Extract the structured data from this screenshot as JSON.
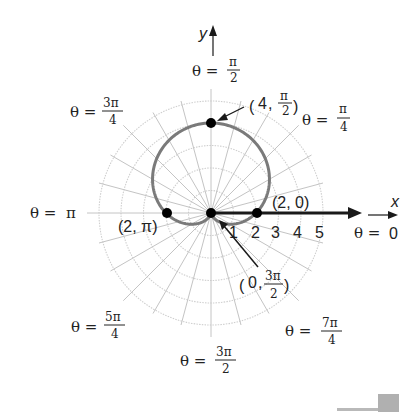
{
  "chart_data": {
    "type": "polar",
    "title": "",
    "equation_depicted": "cardioid r = 2 + 2 sin θ",
    "axes": {
      "x_label": "x",
      "y_label": "y",
      "polar_axis_label": "θ = 0",
      "radial_ticks": [
        "1",
        "2",
        "3",
        "4",
        "5"
      ],
      "radial_range": [
        0,
        5
      ],
      "grid": true
    },
    "angle_labels": [
      {
        "name": "theta-0",
        "eq": "θ = ",
        "num": "0",
        "den": ""
      },
      {
        "name": "theta-pi-4",
        "eq": "θ = ",
        "num": "π",
        "den": "4"
      },
      {
        "name": "theta-pi-2",
        "eq": "θ = ",
        "num": "π",
        "den": "2"
      },
      {
        "name": "theta-3pi-4",
        "eq": "θ = ",
        "num": "3π",
        "den": "4"
      },
      {
        "name": "theta-pi",
        "eq": "θ = ",
        "num": "π",
        "den": ""
      },
      {
        "name": "theta-5pi-4",
        "eq": "θ = ",
        "num": "5π",
        "den": "4"
      },
      {
        "name": "theta-3pi-2",
        "eq": "θ = ",
        "num": "3π",
        "den": "2"
      },
      {
        "name": "theta-7pi-4",
        "eq": "θ = ",
        "num": "7π",
        "den": "4"
      }
    ],
    "points": [
      {
        "label": "(4, π/2)",
        "r": 4,
        "theta": "π/2",
        "text_open": "(4, ",
        "num": "π",
        "den": "2",
        "text_close": ")"
      },
      {
        "label": "(2, 0)",
        "r": 2,
        "theta": "0",
        "text": "(2, 0)"
      },
      {
        "label": "(2, π)",
        "r": 2,
        "theta": "π",
        "text": "(2, π)"
      },
      {
        "label": "(0, 3π/2)",
        "r": 0,
        "theta": "3π/2",
        "text_open": "(0, ",
        "num": "3π",
        "den": "2",
        "text_close": ")"
      }
    ],
    "colors": {
      "curve": "#777777",
      "grid": "#c8c8c8",
      "axis": "#1a1a1a",
      "point": "#000000"
    }
  }
}
